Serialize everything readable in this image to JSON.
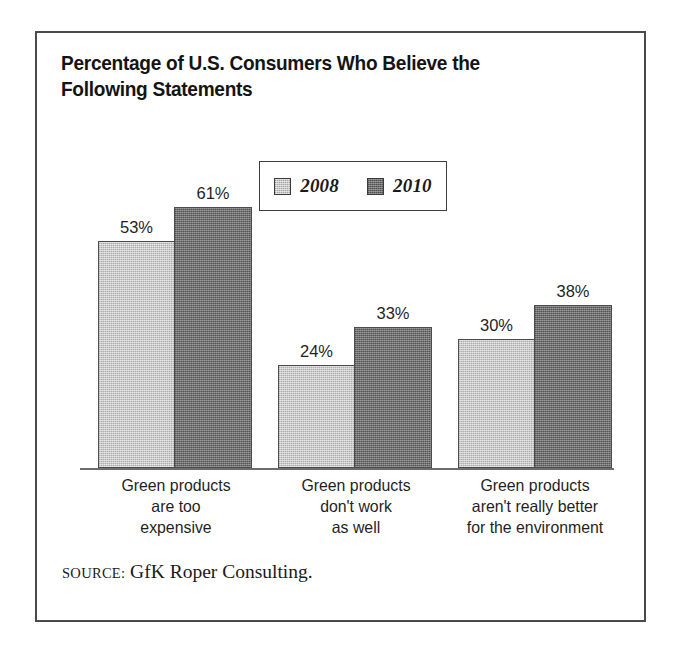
{
  "figure": {
    "title": "Percentage of U.S. Consumers Who Believe the\nFollowing Statements",
    "source_label": "SOURCE:",
    "source_text": "GfK Roper Consulting."
  },
  "legend": {
    "entries": [
      {
        "label": "2008",
        "swatch": "light-gray-swatch",
        "color": "#c9c9c9"
      },
      {
        "label": "2010",
        "swatch": "dark-gray-swatch",
        "color": "#6f6f6f"
      }
    ]
  },
  "chart_data": {
    "type": "bar",
    "title": "Percentage of U.S. Consumers Who Believe the Following Statements",
    "subtitle": "",
    "xlabel": "",
    "ylabel": "",
    "ylim": [
      0,
      70
    ],
    "grid": false,
    "legend_position": "top-center",
    "categories": [
      "Green products\nare too\nexpensive",
      "Green products\ndon't work\nas well",
      "Green products\naren't really better\nfor the environment"
    ],
    "series": [
      {
        "name": "2008",
        "color": "#c9c9c9",
        "values": [
          53,
          24,
          30
        ],
        "labels": [
          "53%",
          "24%",
          "30%"
        ]
      },
      {
        "name": "2010",
        "color": "#6f6f6f",
        "values": [
          61,
          33,
          38
        ],
        "labels": [
          "61%",
          "33%",
          "38%"
        ]
      }
    ],
    "value_suffix": "%",
    "source": "SOURCE: GfK Roper Consulting."
  }
}
